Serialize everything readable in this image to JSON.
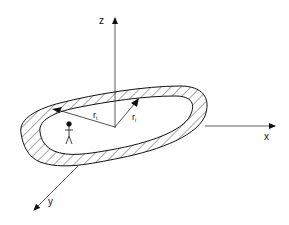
{
  "diagram": {
    "axes": {
      "z_label": "z",
      "x_label": "x",
      "y_label": "y"
    },
    "radii": {
      "outer_label": "r",
      "outer_subscript": "t",
      "inner_label": "r",
      "inner_subscript": "i"
    },
    "figure": "stick-figure-person",
    "ring_fill": "hatched",
    "colors": {
      "line": "#111111",
      "background": "#ffffff"
    }
  }
}
